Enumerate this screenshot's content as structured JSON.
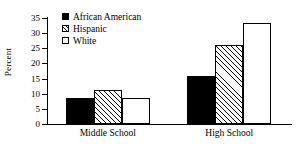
{
  "chart_data": {
    "type": "bar",
    "title": "",
    "xlabel": "",
    "ylabel": "Percent",
    "categories": [
      "Middle School",
      "High School"
    ],
    "series": [
      {
        "name": "African American",
        "pattern": "solid",
        "values": [
          8.7,
          15.8
        ]
      },
      {
        "name": "Hispanic",
        "pattern": "hatch",
        "values": [
          11.2,
          26.2
        ]
      },
      {
        "name": "White",
        "pattern": "open",
        "values": [
          8.7,
          33.2
        ]
      }
    ],
    "ylim": [
      0,
      35
    ],
    "ytick_values": [
      0,
      5,
      10,
      15,
      20,
      25,
      30,
      35
    ],
    "ytick_labels": [
      "0",
      "5",
      "10",
      "15",
      "20",
      "25",
      "30",
      "35"
    ],
    "grid": false,
    "legend_position": "top-left",
    "legend_entries": [
      "African American",
      "Hispanic",
      "White"
    ]
  }
}
